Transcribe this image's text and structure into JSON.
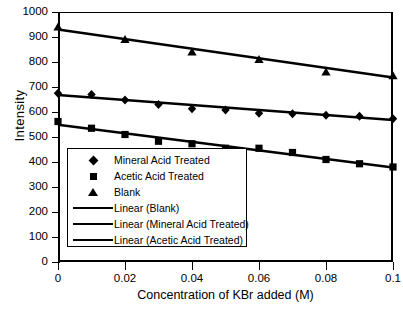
{
  "chart_data": {
    "type": "scatter",
    "title": "",
    "xlabel": "Concentration of KBr added (M)",
    "ylabel": "Intensity",
    "xlim": [
      0,
      0.1
    ],
    "ylim": [
      0,
      1000
    ],
    "xticks": [
      "0",
      "0.02",
      "0.04",
      "0.06",
      "0.08",
      "0.1"
    ],
    "xtick_values": [
      0,
      0.02,
      0.04,
      0.06,
      0.08,
      0.1
    ],
    "yticks": [
      "0",
      "100",
      "200",
      "300",
      "400",
      "500",
      "600",
      "700",
      "800",
      "900",
      "1000"
    ],
    "ytick_values": [
      0,
      100,
      200,
      300,
      400,
      500,
      600,
      700,
      800,
      900,
      1000
    ],
    "grid": false,
    "legend_position": "inside-lower-left",
    "marker_color": "#000000",
    "line_color": "#000000",
    "series": [
      {
        "name": "Mineral Acid Treated",
        "marker": "diamond",
        "x": [
          0,
          0.01,
          0.02,
          0.03,
          0.04,
          0.05,
          0.06,
          0.07,
          0.08,
          0.09,
          0.1
        ],
        "values": [
          675,
          670,
          648,
          630,
          613,
          608,
          595,
          593,
          587,
          583,
          573
        ]
      },
      {
        "name": "Acetic Acid Treated",
        "marker": "square",
        "x": [
          0,
          0.01,
          0.02,
          0.03,
          0.04,
          0.05,
          0.06,
          0.07,
          0.08,
          0.09,
          0.1
        ],
        "values": [
          562,
          535,
          510,
          483,
          473,
          455,
          455,
          438,
          410,
          393,
          380
        ]
      },
      {
        "name": "Blank",
        "marker": "triangle",
        "x": [
          0,
          0.02,
          0.04,
          0.06,
          0.08,
          0.1
        ],
        "values": [
          940,
          890,
          840,
          810,
          760,
          745
        ]
      }
    ],
    "trendlines": [
      {
        "name": "Linear (Blank)",
        "x0": 0,
        "y0": 930,
        "x1": 0.1,
        "y1": 738
      },
      {
        "name": "Linear (Mineral Acid Treated)",
        "x0": 0,
        "y0": 668,
        "x1": 0.1,
        "y1": 568
      },
      {
        "name": "Linear (Acetic Acid Treated)",
        "x0": 0,
        "y0": 549,
        "x1": 0.1,
        "y1": 378
      }
    ]
  },
  "axes": {
    "ylabel": "Intensity",
    "xlabel": "Concentration of KBr added (M)",
    "ytick_labels": [
      "1000",
      "900",
      "800",
      "700",
      "600",
      "500",
      "400",
      "300",
      "200",
      "100",
      "0"
    ],
    "xtick_labels": [
      "0",
      "0.02",
      "0.04",
      "0.06",
      "0.08",
      "0.1"
    ]
  },
  "legend": {
    "entries": [
      {
        "label": "Mineral Acid Treated",
        "key": "diamond"
      },
      {
        "label": "Acetic Acid Treated",
        "key": "square"
      },
      {
        "label": "Blank",
        "key": "triangle"
      },
      {
        "label": "Linear (Blank)",
        "key": "line"
      },
      {
        "label": "Linear (Mineral Acid Treated)",
        "key": "line"
      },
      {
        "label": "Linear (Acetic Acid Treated)",
        "key": "line"
      }
    ]
  }
}
